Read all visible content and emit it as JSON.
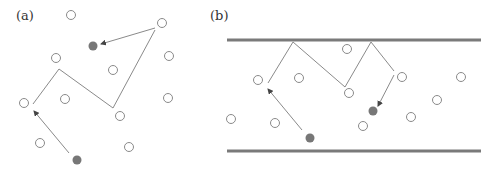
{
  "panels": [
    {
      "label": "(a)",
      "open_particles": [
        [
          71,
          15
        ],
        [
          162,
          23
        ],
        [
          56,
          58
        ],
        [
          169,
          56
        ],
        [
          113,
          70
        ],
        [
          65,
          99
        ],
        [
          168,
          98
        ],
        [
          24,
          103
        ],
        [
          120,
          116
        ],
        [
          40,
          143
        ],
        [
          129,
          147
        ]
      ],
      "filled_particles": [
        [
          93,
          46
        ],
        [
          77,
          160
        ]
      ],
      "path_lines": [
        [
          [
            33,
            104
          ],
          [
            59,
            69
          ]
        ],
        [
          [
            59,
            69
          ],
          [
            113,
            108
          ]
        ],
        [
          [
            113,
            108
          ],
          [
            155,
            30
          ]
        ]
      ],
      "arrows": [
        [
          [
            69,
            153
          ],
          [
            34,
            111
          ]
        ],
        [
          [
            155,
            28
          ],
          [
            101,
            44
          ]
        ]
      ]
    },
    {
      "label": "(b)",
      "walls": {
        "top_y": 40,
        "bottom_y": 151,
        "x1": 227,
        "x2": 481
      },
      "open_particles": [
        [
          258,
          80
        ],
        [
          299,
          78
        ],
        [
          347,
          49
        ],
        [
          349,
          93
        ],
        [
          402,
          77
        ],
        [
          461,
          77
        ],
        [
          437,
          100
        ],
        [
          231,
          119
        ],
        [
          275,
          123
        ],
        [
          363,
          126
        ],
        [
          411,
          117
        ]
      ],
      "filled_particles": [
        [
          310,
          138
        ],
        [
          373,
          111
        ]
      ],
      "path_lines": [
        [
          [
            268,
            83
          ],
          [
            293,
            42
          ]
        ],
        [
          [
            293,
            42
          ],
          [
            345,
            87
          ]
        ],
        [
          [
            345,
            87
          ],
          [
            371,
            42
          ]
        ],
        [
          [
            371,
            42
          ],
          [
            394,
            71
          ]
        ]
      ],
      "arrows": [
        [
          [
            302,
            130
          ],
          [
            268,
            89
          ]
        ],
        [
          [
            394,
            75
          ],
          [
            378,
            106
          ]
        ]
      ]
    }
  ],
  "colors": {
    "open_stroke": "#8a8a8a",
    "filled": "#777777",
    "line": "#8a8a8a",
    "wall": "#7a7a7a"
  }
}
